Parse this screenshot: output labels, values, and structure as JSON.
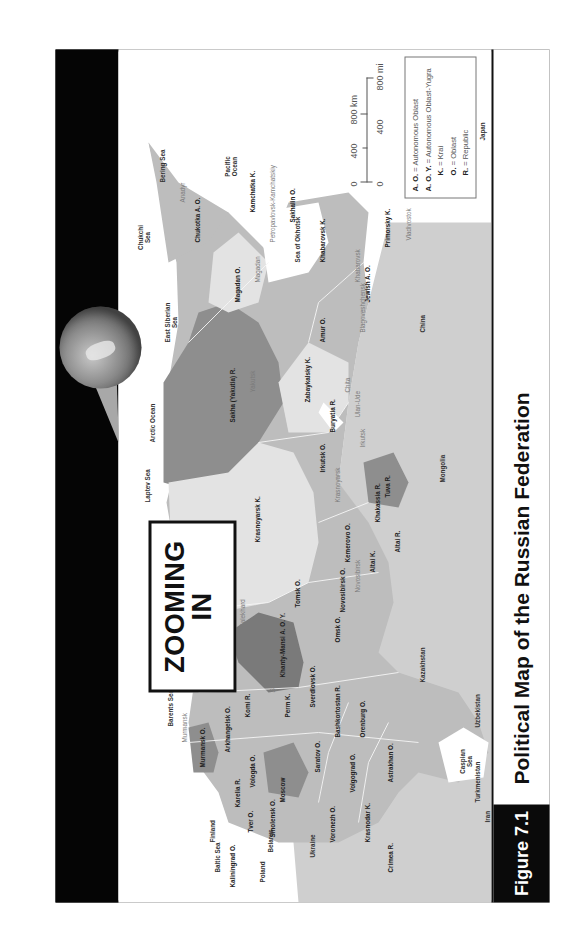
{
  "header": {
    "zoom_title_line1": "ZOOMING",
    "zoom_title_line2": "IN"
  },
  "caption": {
    "figure_label": "Figure 7.1",
    "title": "Political Map of the Russian Federation"
  },
  "scale_bar": {
    "km_ticks": [
      "0",
      "400",
      "800 km"
    ],
    "mi_ticks": [
      "0",
      "400",
      "800 mi"
    ]
  },
  "legend": {
    "items": [
      {
        "abbr": "A. O.",
        "meaning": "= Autonomous Oblast"
      },
      {
        "abbr": "A. O. Y.",
        "meaning": "= Autonomous Oblast-Yugra"
      },
      {
        "abbr": "K.",
        "meaning": "= Krai"
      },
      {
        "abbr": "O.",
        "meaning": "= Oblast"
      },
      {
        "abbr": "R.",
        "meaning": "= Republic"
      }
    ]
  },
  "map": {
    "colors": {
      "land_neighbor": "#cfcfcf",
      "water": "#ffffff",
      "region_light": "#e3e3e3",
      "region_mid": "#bdbdbd",
      "region_dark": "#8e8e8e",
      "region_darkest": "#7a7a7a",
      "frame": "#111111"
    },
    "seas": [
      "Arctic Ocean",
      "Barents Sea",
      "Kara Sea",
      "Laptev Sea",
      "East Siberian Sea",
      "Chukchi Sea",
      "Bering Sea",
      "Pacific Ocean",
      "Sea of Okhotsk",
      "Baltic Sea",
      "Caspian Sea"
    ],
    "countries": [
      "Finland",
      "Poland",
      "Belarus",
      "Ukraine",
      "Kazakhstan",
      "Uzbekistan",
      "Turkmenistan",
      "Iran",
      "Mongolia",
      "China",
      "Japan"
    ],
    "regions": [
      "Kaliningrad O.",
      "Murmansk O.",
      "Karelia R.",
      "Leningrad O.",
      "Pskov O.",
      "Novgorod O.",
      "Tver O.",
      "Smolensk O.",
      "Moscow",
      "Vologda O.",
      "Yaroslavl O.",
      "Ivanovo O.",
      "Kostroma O.",
      "Vladimir O.",
      "Ryazan O.",
      "Kaluga O.",
      "Bryansk O.",
      "Oryol O.",
      "Tula O.",
      "Kursk O.",
      "Lipetsk O.",
      "Belgorod O.",
      "Voronezh O.",
      "Tambov O.",
      "Penza O.",
      "Mordovia R.",
      "Nizhny Novgorod O.",
      "Mari El R.",
      "Chuvash R.",
      "Ulyanovsk O.",
      "Tatarstan R.",
      "Kirov O.",
      "Udmurt R.",
      "Samara",
      "Saratov O.",
      "Volgograd O.",
      "Rostov O.",
      "Krasnodar K.",
      "Adygea R.",
      "Karachay-Cherkessia R.",
      "Kabardino-Balkar R.",
      "Stavropol K.",
      "North Ossetia-Alania R.",
      "Ingushetia R.",
      "Chechen R.",
      "Dagestan R.",
      "Kalmykia R.",
      "Astrakhan O.",
      "Crimea R.",
      "Arkhangelsk O.",
      "Nenets A. O.",
      "Komi R.",
      "Perm K.",
      "Sverdlovsk O.",
      "Bashkortostan R.",
      "Orenburg O.",
      "Chelyabinsk O.",
      "Kurgan O.",
      "Tyumen O.",
      "Khanty-Mansi A. O. Y.",
      "Yamalo-Nenets A. O.",
      "Omsk O.",
      "Tomsk O.",
      "Novosibirsk O.",
      "Altai K.",
      "Altai R.",
      "Kemerovo O.",
      "Khakassia R.",
      "Tuva R.",
      "Krasnoyarsk K.",
      "Irkutsk O.",
      "Buryatia R.",
      "Zabaykalsky K.",
      "Sakha (Yakutia) R.",
      "Amur O.",
      "Jewish A. O.",
      "Khabarovsk K.",
      "Primorsky K.",
      "Sakhalin O.",
      "Magadan O.",
      "Chukotka A. O.",
      "Kamchatka K."
    ],
    "cities": [
      "Murmansk",
      "Saint Petersburg",
      "Arkhangelsk",
      "Naryan-Mar",
      "Syktyvkar",
      "Salekhard",
      "Perm",
      "Yekaterinburg",
      "Ufa",
      "Orenburg",
      "Chelyabinsk",
      "Kurgan",
      "Tyumen",
      "Khanty-Mansiysk",
      "Omsk",
      "Tomsk",
      "Novosibirsk",
      "Barnaul",
      "Kemerovo",
      "Gorno-Altaysk",
      "Abakan",
      "Kyzyl",
      "Krasnoyarsk",
      "Igarka",
      "Irkutsk",
      "Ulan-Ude",
      "Chita",
      "Yakutsk",
      "Blagoveshchensk",
      "Birobidzhan",
      "Khabarovsk",
      "Vladivostok",
      "Yuzhno-Sakhalinsk",
      "Magadan",
      "Petropavlovsk-Kamchatskiy",
      "Anadyr",
      "Vladikavkaz"
    ]
  }
}
